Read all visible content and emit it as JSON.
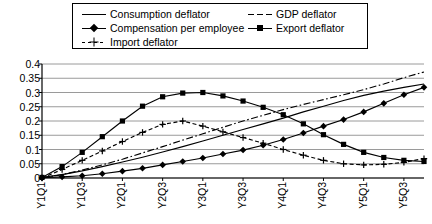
{
  "legend": {
    "position": "top",
    "entries": [
      {
        "label": "Consumption deflator",
        "style": "solid",
        "marker": "none",
        "col": 0,
        "row": 0
      },
      {
        "label": "GDP deflator",
        "style": "dashdot",
        "marker": "none",
        "col": 1,
        "row": 0
      },
      {
        "label": "Compensation per employee",
        "style": "solid",
        "marker": "diamond",
        "col": 0,
        "row": 1
      },
      {
        "label": "Export deflator",
        "style": "solid",
        "marker": "square",
        "col": 1,
        "row": 1
      },
      {
        "label": "Import deflator",
        "style": "dashed",
        "marker": "plus",
        "col": 0,
        "row": 2
      }
    ]
  },
  "chart_data": {
    "type": "line",
    "title": "",
    "xlabel": "",
    "ylabel": "",
    "grid": true,
    "ylim": [
      0,
      0.4
    ],
    "ytick_step": 0.05,
    "yticks": [
      "0",
      "0.05",
      "0.1",
      "0.15",
      "0.2",
      "0.25",
      "0.3",
      "0.35",
      "0.4"
    ],
    "ytick_values": [
      0,
      0.05,
      0.1,
      0.15,
      0.2,
      0.25,
      0.3,
      0.35,
      0.4
    ],
    "x": [
      "Y1Q1",
      "Y1Q2",
      "Y1Q3",
      "Y1Q4",
      "Y2Q1",
      "Y2Q2",
      "Y2Q3",
      "Y2Q4",
      "Y3Q1",
      "Y3Q2",
      "Y3Q3",
      "Y3Q4",
      "Y4Q1",
      "Y4Q2",
      "Y4Q3",
      "Y4Q4",
      "Y5Q1",
      "Y5Q2",
      "Y5Q3",
      "Y5Q4"
    ],
    "xticklabels": [
      "Y1Q1",
      "Y1Q3",
      "Y2Q1",
      "Y2Q3",
      "Y3Q1",
      "Y3Q3",
      "Y4Q1",
      "Y4Q3",
      "Y5Q1",
      "Y5Q3"
    ],
    "xticklabel_indices": [
      0,
      2,
      4,
      6,
      8,
      10,
      12,
      14,
      16,
      18
    ],
    "xticklabel_rotation": 90,
    "series": [
      {
        "name": "Consumption deflator",
        "style": "solid",
        "marker": "none",
        "values": [
          0.002,
          0.012,
          0.025,
          0.04,
          0.056,
          0.073,
          0.091,
          0.11,
          0.13,
          0.15,
          0.17,
          0.19,
          0.21,
          0.232,
          0.252,
          0.272,
          0.29,
          0.305,
          0.318,
          0.33
        ]
      },
      {
        "name": "GDP deflator",
        "style": "dashdot",
        "marker": "none",
        "values": [
          0.0,
          0.012,
          0.028,
          0.046,
          0.066,
          0.088,
          0.11,
          0.133,
          0.155,
          0.178,
          0.2,
          0.22,
          0.24,
          0.258,
          0.275,
          0.292,
          0.31,
          0.33,
          0.352,
          0.372
        ]
      },
      {
        "name": "Compensation per employee",
        "style": "solid",
        "marker": "diamond",
        "values": [
          0.001,
          0.004,
          0.008,
          0.015,
          0.024,
          0.034,
          0.046,
          0.058,
          0.07,
          0.084,
          0.098,
          0.115,
          0.135,
          0.158,
          0.182,
          0.205,
          0.232,
          0.262,
          0.292,
          0.318
        ]
      },
      {
        "name": "Export deflator",
        "style": "solid",
        "marker": "square",
        "values": [
          0.002,
          0.04,
          0.09,
          0.145,
          0.2,
          0.252,
          0.285,
          0.298,
          0.3,
          0.288,
          0.27,
          0.248,
          0.222,
          0.19,
          0.152,
          0.118,
          0.09,
          0.072,
          0.062,
          0.058
        ]
      },
      {
        "name": "Import deflator",
        "style": "dashed",
        "marker": "plus",
        "values": [
          0.0,
          0.03,
          0.062,
          0.095,
          0.128,
          0.16,
          0.188,
          0.2,
          0.182,
          0.162,
          0.142,
          0.122,
          0.1,
          0.08,
          0.062,
          0.05,
          0.046,
          0.048,
          0.055,
          0.068
        ]
      }
    ],
    "series_tail": [
      {
        "name": "Export deflator",
        "values": [
          0.05,
          0.05,
          0.055,
          0.065,
          0.08,
          0.1
        ]
      },
      {
        "name": "Import deflator",
        "values": [
          0.046,
          0.048,
          0.052,
          0.06,
          0.072,
          0.088
        ]
      }
    ]
  }
}
